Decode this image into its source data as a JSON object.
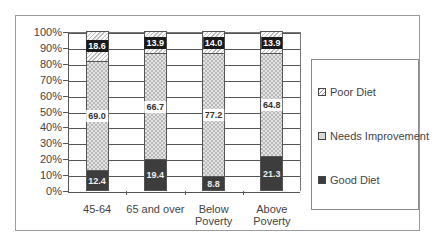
{
  "chart_data": {
    "type": "bar",
    "stacked": true,
    "title": "",
    "xlabel": "",
    "ylabel": "",
    "ylim": [
      0,
      100
    ],
    "yticks": [
      "0%",
      "10%",
      "20%",
      "30%",
      "40%",
      "50%",
      "60%",
      "70%",
      "80%",
      "90%",
      "100%"
    ],
    "categories": [
      "45-64",
      "65 and over",
      "Below Poverty",
      "Above Poverty"
    ],
    "category_lines": [
      [
        "45-64"
      ],
      [
        "65 and over"
      ],
      [
        "Below",
        "Poverty"
      ],
      [
        "Above",
        "Poverty"
      ]
    ],
    "series": [
      {
        "name": "Good Diet",
        "values": [
          12.4,
          19.4,
          8.8,
          21.3
        ],
        "color": "#3d3d3d",
        "pattern": "solid"
      },
      {
        "name": "Needs Improvement",
        "values": [
          69.0,
          66.7,
          77.2,
          64.8
        ],
        "color": "#d8d8d8",
        "pattern": "crosshatch"
      },
      {
        "name": "Poor Diet",
        "values": [
          18.6,
          13.9,
          14.0,
          13.9
        ],
        "color": "#ffffff",
        "pattern": "diagonal"
      }
    ],
    "value_labels": {
      "Good Diet": [
        "12.4",
        "19.4",
        "8.8",
        "21.3"
      ],
      "Needs Improvement": [
        "69.0",
        "66.7",
        "77.2",
        "64.8"
      ],
      "Poor Diet": [
        "18.6",
        "13.9",
        "14.0",
        "13.9"
      ]
    },
    "grid": true,
    "legend_position": "right",
    "legend": [
      "Poor Diet",
      "Needs Improvement",
      "Good Diet"
    ]
  }
}
